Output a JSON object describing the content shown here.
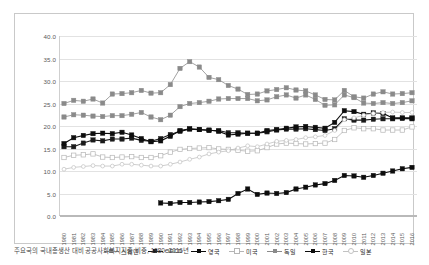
{
  "chart_data": {
    "type": "line",
    "title": "",
    "xlabel": "",
    "ylabel": "",
    "ylim": [
      0.0,
      40.0
    ],
    "ytick_step": 5.0,
    "yticks": [
      "0.0",
      "5.0",
      "10.0",
      "15.0",
      "20.0",
      "25.0",
      "30.0",
      "35.0",
      "40.0"
    ],
    "grid": true,
    "legend_position": "bottom",
    "x": [
      1980,
      1981,
      1982,
      1983,
      1984,
      1985,
      1986,
      1987,
      1988,
      1989,
      1990,
      1991,
      1992,
      1993,
      1994,
      1995,
      1996,
      1997,
      1998,
      1999,
      2000,
      2001,
      2002,
      2003,
      2004,
      2005,
      2006,
      2007,
      2008,
      2009,
      2010,
      2011,
      2012,
      2013,
      2014,
      2015,
      2016
    ],
    "series": [
      {
        "name": "스웨덴",
        "marker": "filled-square",
        "color": "#8a8a8a",
        "values": [
          25.0,
          25.7,
          25.5,
          26.0,
          25.1,
          27.1,
          27.2,
          27.4,
          27.9,
          27.3,
          27.4,
          29.2,
          32.8,
          34.3,
          33.1,
          30.8,
          30.3,
          29.0,
          28.2,
          27.0,
          27.1,
          27.8,
          28.1,
          28.5,
          28.0,
          27.8,
          26.9,
          25.9,
          25.8,
          27.9,
          26.5,
          26.2,
          27.1,
          27.6,
          27.1,
          27.2,
          27.4
        ]
      },
      {
        "name": "OECD",
        "marker": "filled-square",
        "color": "#1a1a1a",
        "values": [
          15.4,
          15.4,
          16.2,
          16.9,
          16.7,
          17.1,
          17.1,
          17.3,
          16.8,
          16.6,
          17.2,
          18.1,
          18.8,
          19.3,
          19.2,
          19.0,
          19.0,
          18.5,
          18.5,
          18.4,
          18.4,
          18.7,
          19.1,
          19.3,
          19.3,
          19.4,
          19.2,
          19.0,
          19.4,
          21.6,
          21.3,
          21.3,
          21.5,
          21.6,
          21.6,
          21.7,
          21.6
        ]
      },
      {
        "name": "영국",
        "marker": "filled-square",
        "color": "#0d0d0d",
        "values": [
          16.1,
          17.4,
          17.9,
          18.3,
          18.4,
          18.3,
          18.6,
          18.0,
          17.2,
          16.5,
          16.7,
          17.7,
          19.0,
          19.4,
          19.2,
          19.1,
          18.8,
          18.0,
          18.2,
          18.4,
          18.4,
          19.0,
          19.2,
          19.5,
          19.8,
          19.9,
          19.7,
          19.5,
          20.8,
          23.4,
          23.2,
          22.6,
          22.9,
          22.8,
          21.8,
          21.8,
          21.8
        ]
      },
      {
        "name": "미국",
        "marker": "open-square",
        "color": "#b5b5b5",
        "values": [
          13.0,
          13.5,
          13.6,
          13.8,
          13.1,
          13.0,
          13.1,
          13.2,
          13.0,
          13.0,
          13.4,
          14.2,
          14.8,
          15.0,
          15.1,
          15.2,
          14.9,
          14.8,
          14.6,
          14.4,
          14.5,
          15.2,
          16.0,
          16.2,
          16.1,
          16.0,
          16.1,
          16.2,
          17.0,
          19.0,
          19.6,
          19.4,
          19.4,
          19.1,
          19.1,
          19.1,
          19.8
        ]
      },
      {
        "name": "독일",
        "marker": "filled-square",
        "color": "#8a8a8a",
        "values": [
          22.0,
          22.5,
          22.4,
          22.2,
          22.1,
          22.3,
          22.3,
          22.6,
          23.0,
          22.0,
          21.4,
          22.4,
          24.3,
          25.0,
          25.2,
          25.5,
          26.0,
          26.1,
          26.1,
          26.1,
          25.6,
          25.8,
          26.5,
          26.9,
          26.2,
          26.9,
          25.9,
          24.6,
          24.7,
          26.9,
          26.3,
          25.1,
          25.0,
          25.2,
          25.0,
          25.2,
          25.6
        ]
      },
      {
        "name": "한국",
        "marker": "filled-square",
        "color": "#0d0d0d",
        "values": [
          null,
          null,
          null,
          null,
          null,
          null,
          null,
          null,
          null,
          null,
          2.9,
          2.8,
          3.0,
          3.0,
          3.1,
          3.2,
          3.4,
          3.7,
          5.0,
          6.0,
          4.8,
          5.1,
          5.0,
          5.2,
          6.0,
          6.4,
          6.9,
          7.2,
          7.9,
          9.0,
          8.9,
          8.6,
          9.0,
          9.5,
          10.0,
          10.5,
          10.8
        ]
      },
      {
        "name": "일본",
        "marker": "open-circle",
        "color": "#c2c2c2",
        "values": [
          10.4,
          10.8,
          11.0,
          11.2,
          11.1,
          11.1,
          11.5,
          11.5,
          11.3,
          11.1,
          11.1,
          11.5,
          12.0,
          12.6,
          13.1,
          13.8,
          14.2,
          14.5,
          15.1,
          15.6,
          15.4,
          16.0,
          16.6,
          16.8,
          17.0,
          17.4,
          17.6,
          17.9,
          19.0,
          21.4,
          21.8,
          22.4,
          22.8,
          23.0,
          23.1,
          23.0,
          23.0
        ]
      }
    ]
  },
  "legend": {
    "items": [
      {
        "label": "스웨덴",
        "marker": "filled-square",
        "color": "#8a8a8a"
      },
      {
        "label": "OECD",
        "marker": "filled-square",
        "color": "#1a1a1a"
      },
      {
        "label": "영국",
        "marker": "filled-square",
        "color": "#0d0d0d"
      },
      {
        "label": "미국",
        "marker": "open-square",
        "color": "#b5b5b5"
      },
      {
        "label": "독일",
        "marker": "filled-square",
        "color": "#8a8a8a"
      },
      {
        "label": "한국",
        "marker": "filled-square",
        "color": "#0d0d0d"
      },
      {
        "label": "일본",
        "marker": "open-circle",
        "color": "#c2c2c2"
      }
    ]
  },
  "caption": {
    "text": "주요국의 국내총생산 대비 공공사회복지지출 비중, 1980~2016년"
  }
}
